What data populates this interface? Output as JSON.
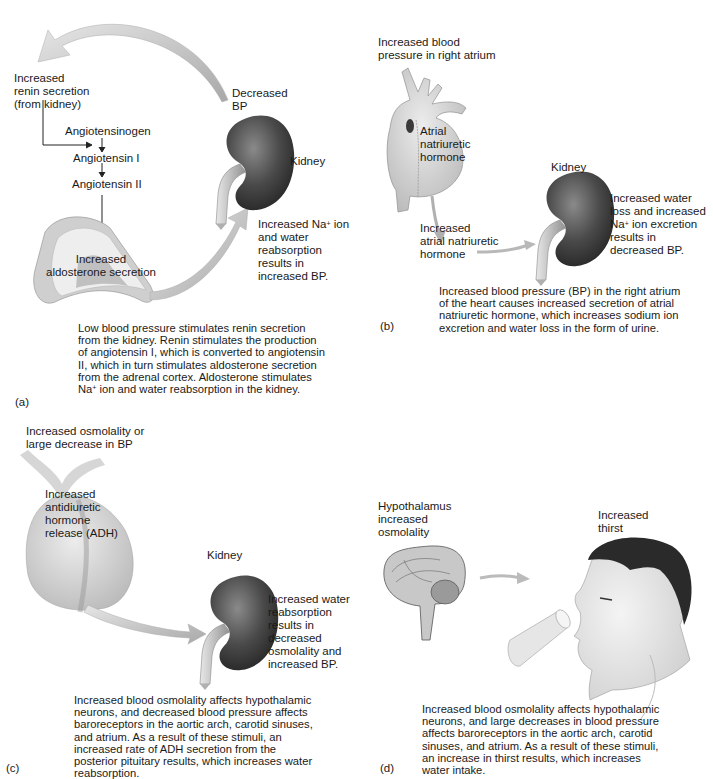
{
  "panels": {
    "a": {
      "label": "(a)",
      "renin": "Increased\nrenin secretion\n(from kidney)",
      "decreased_bp": "Decreased\nBP",
      "angiotensinogen": "Angiotensinogen",
      "angiotensin_1": "Angiotensin I",
      "angiotensin_2": "Angiotensin II",
      "kidney": "Kidney",
      "aldosterone": "Increased\naldosterone secretion",
      "result_pre": "Increased Na",
      "result_sup": "+",
      "result_post": " ion\nand water\nreabsorption\nresults in\nincreased BP.",
      "caption_pre": "Low blood pressure stimulates renin secretion\nfrom the kidney. Renin stimulates the production\nof angiotensin I, which is converted to angiotensin\nII, which in turn stimulates aldosterone secretion\nfrom the adrenal cortex. Aldosterone stimulates\nNa",
      "caption_sup": "+",
      "caption_post": " ion and water reabsorption in the kidney."
    },
    "b": {
      "label": "(b)",
      "stimulus": "Increased blood\npressure in right atrium",
      "heart_label": "Atrial\nnatriuretic\nhormone",
      "kidney": "Kidney",
      "anh": "Increased\natrial natriuretic\nhormone",
      "result_pre": "Increased water\nloss and increased\nNa",
      "result_sup": "+",
      "result_post": " ion excretion\nresults in\ndecreased BP.",
      "caption": "Increased blood pressure (BP) in the right atrium\nof the heart causes increased secretion of atrial\nnatriuretic hormone, which increases sodium ion\nexcretion and water loss in the form of urine."
    },
    "c": {
      "label": "(c)",
      "stimulus": "Increased osmolality or\nlarge decrease in BP",
      "adh": "Increased\nantidiuretic\nhormone\nrelease (ADH)",
      "kidney": "Kidney",
      "result": "Increased water\nreabsorption\nresults in\ndecreased\nosmolality and\nincreased BP.",
      "caption": "Increased blood osmolality affects hypothalamic\nneurons, and decreased blood pressure affects\nbaroreceptors in the aortic arch, carotid sinuses,\nand atrium. As a result of these stimuli, an\nincreased rate of ADH secretion from the\nposterior pituitary results, which increases water\nreabsorption."
    },
    "d": {
      "label": "(d)",
      "hypothalamus": "Hypothalamus\nincreased\nosmolality",
      "thirst": "Increased\nthirst",
      "caption": "Increased blood osmolality affects hypothalamic\nneurons, and large decreases in blood pressure\naffects baroreceptors in the aortic arch, carotid\nsinuses, and atrium. As a result of these stimuli,\nan increase in thirst results, which increases\nwater intake."
    }
  },
  "colors": {
    "kidney_dark": "#3a3a3a",
    "kidney_mid": "#6e6e6e",
    "arrow_gray": "#c4c4c4",
    "organ_light": "#d8d8d8",
    "text": "#1a1a1a"
  }
}
